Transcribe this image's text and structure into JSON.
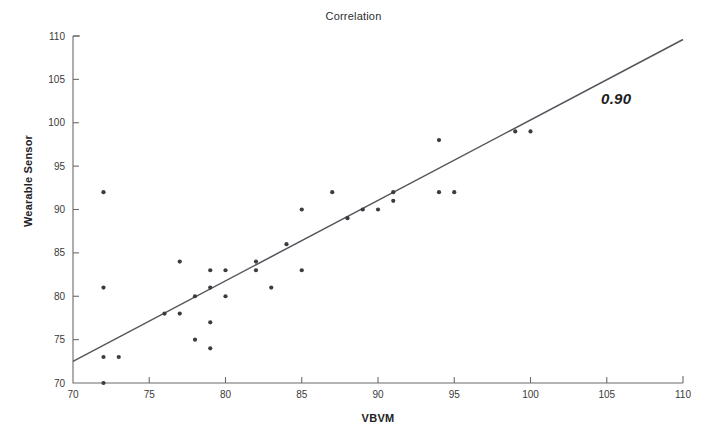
{
  "chart_data": {
    "type": "scatter",
    "title": "Correlation",
    "xlabel": "VBVM",
    "ylabel": "Wearable Sensor",
    "xlim": [
      70,
      110
    ],
    "ylim": [
      70,
      110
    ],
    "xticks": [
      70,
      75,
      80,
      85,
      90,
      95,
      100,
      105,
      110
    ],
    "yticks": [
      70,
      75,
      80,
      85,
      90,
      95,
      100,
      105,
      110
    ],
    "grid": false,
    "legend": false,
    "annotations": [
      {
        "text": "0.90",
        "x": 105.5,
        "y": 103.5,
        "style": "bold-italic"
      }
    ],
    "series": [
      {
        "name": "Wearable Sensor vs VBVM",
        "marker": "filled-circle",
        "color": "#3b3b42",
        "points": [
          [
            72,
            92
          ],
          [
            72,
            81
          ],
          [
            72,
            73
          ],
          [
            73,
            73
          ],
          [
            72,
            70
          ],
          [
            76,
            78
          ],
          [
            77,
            78
          ],
          [
            77,
            84
          ],
          [
            78,
            80
          ],
          [
            78,
            75
          ],
          [
            79,
            81
          ],
          [
            79,
            83
          ],
          [
            79,
            77
          ],
          [
            79,
            74
          ],
          [
            80,
            83
          ],
          [
            80,
            80
          ],
          [
            82,
            84
          ],
          [
            82,
            83
          ],
          [
            83,
            81
          ],
          [
            84,
            86
          ],
          [
            85,
            90
          ],
          [
            85,
            83
          ],
          [
            87,
            92
          ],
          [
            88,
            89
          ],
          [
            89,
            90
          ],
          [
            90,
            90
          ],
          [
            91,
            92
          ],
          [
            91,
            91
          ],
          [
            94,
            98
          ],
          [
            94,
            92
          ],
          [
            95,
            92
          ],
          [
            99,
            99
          ],
          [
            100,
            99
          ]
        ]
      }
    ],
    "trendline": {
      "name": "linear-fit",
      "color": "#55565c",
      "x_start": 70,
      "y_start": 72.5,
      "x_end": 110,
      "y_end": 109.6
    }
  },
  "axes": {
    "plot_left_px": 73,
    "plot_right_px": 683,
    "plot_top_px": 36,
    "plot_bottom_px": 383
  }
}
